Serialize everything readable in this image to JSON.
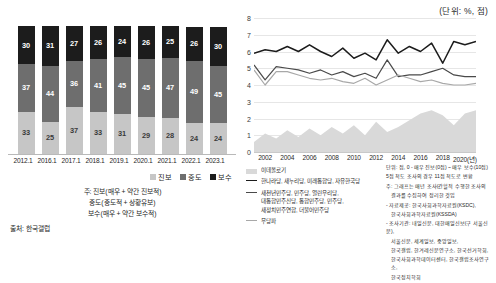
{
  "unit_label": "(단위: %, 점)",
  "left": {
    "legend": [
      {
        "key": "prog",
        "label": "진보",
        "color": "#c6c6c6"
      },
      {
        "key": "mod",
        "label": "중도",
        "color": "#6e6e6e"
      },
      {
        "key": "cons",
        "label": "보수",
        "color": "#1c1c1c"
      }
    ],
    "notes": [
      "주: 진보(매우 + 약간 진보적)",
      "중도(중도적 + 상황유보)",
      "보수(매우 + 약간 보수적)"
    ],
    "source": "출처: 한국갤럽"
  },
  "right": {
    "xaxis_suffix": "2020(년)",
    "legend": [
      {
        "key": "ideology",
        "mark": "area",
        "label": "이데올로기"
      },
      {
        "key": "conservative_parties",
        "mark": "line",
        "label": "한나라당, 새누리당, 미래통합당, 자유한국당"
      },
      {
        "key": "progressive_parties",
        "mark": "line2",
        "label": "새천년민주당, 민주당, 열린우리당,\n대통합민주신당, 통합민주당, 민주당,\n새정치민주연합, 더불어민주당"
      },
      {
        "key": "independent",
        "mark": "line3",
        "label": "무당파"
      }
    ],
    "notes": [
      "단위: 점, 0 - 매우 진보(0점) ~ 매우 보수(10점)",
      "5점 척도 조사의 경우 11점 척도로 변환",
      "주: 그래프는 매년 조사(간헐적 수행한 조사의",
      "결과를 수집하여 정리한 것임",
      "- 자료제공: 한국사회과학자료원(KSDC),",
      "한국사회과학자료원(KSSDA)",
      "- 조사기관: 내일신문, 대한매일신보(구 서울신문),",
      "서울신문, 세계일보, 중앙일보,",
      "한국갤럽, 한겨레신문연구소, 한국선거학회,",
      "한국사회과학데이터센터, 한국갤럽조사연구소,",
      "한국정치학회"
    ]
  },
  "chart_data": [
    {
      "type": "bar",
      "title": "이념성향 분포",
      "xlabel": "",
      "ylabel": "",
      "ylim": [
        0,
        100
      ],
      "stacked": true,
      "grid": false,
      "legend_position": "bottom-right",
      "categories": [
        "2012.1",
        "2016.1",
        "2017.1",
        "2018.1",
        "2019.1",
        "2020.1",
        "2021.1",
        "2022.1",
        "2023.1"
      ],
      "series": [
        {
          "name": "보수",
          "color": "#1c1c1c",
          "values": [
            30,
            31,
            27,
            26,
            24,
            26,
            25,
            26,
            30
          ]
        },
        {
          "name": "중도",
          "color": "#6e6e6e",
          "values": [
            37,
            44,
            36,
            41,
            45,
            45,
            47,
            49,
            45
          ]
        },
        {
          "name": "진보",
          "color": "#c6c6c6",
          "values": [
            33,
            25,
            37,
            33,
            31,
            29,
            28,
            24,
            24
          ]
        }
      ]
    },
    {
      "type": "line",
      "title": "",
      "xlabel": "년",
      "ylabel": "",
      "ylim": [
        0,
        8
      ],
      "yticks": [
        0,
        1,
        2,
        3,
        4,
        5,
        6,
        7,
        8
      ],
      "xlim": [
        2001,
        2021
      ],
      "xticks": [
        2002,
        2004,
        2006,
        2008,
        2010,
        2012,
        2014,
        2016,
        2018,
        2020
      ],
      "grid": true,
      "legend_position": "bottom-left",
      "x": [
        2001,
        2002,
        2003,
        2004,
        2005,
        2006,
        2007,
        2008,
        2009,
        2010,
        2011,
        2012,
        2013,
        2014,
        2015,
        2016,
        2017,
        2018,
        2019,
        2020,
        2021
      ],
      "series": [
        {
          "name": "한나라당, 새누리당, 미래통합당, 자유한국당",
          "color": "#1c1c1c",
          "type": "line",
          "values": [
            5.9,
            6.1,
            6.0,
            6.3,
            6.0,
            6.4,
            6.0,
            5.7,
            6.2,
            5.6,
            5.9,
            5.5,
            6.7,
            5.9,
            6.3,
            6.0,
            6.5,
            5.3,
            6.6,
            6.4,
            6.6
          ]
        },
        {
          "name": "새천년민주당, 민주당, 열린우리당, 대통합민주신당, 통합민주당, 민주당, 새정치민주연합, 더불어민주당",
          "color": "#4a4a4a",
          "type": "line",
          "values": [
            5.2,
            4.3,
            5.1,
            5.0,
            4.9,
            4.7,
            4.9,
            4.6,
            4.8,
            4.5,
            4.7,
            4.4,
            5.5,
            4.5,
            4.6,
            4.6,
            4.8,
            5.0,
            4.6,
            4.5,
            4.5
          ]
        },
        {
          "name": "무당파",
          "color": "#a8a8a8",
          "type": "line",
          "values": [
            4.9,
            4.0,
            4.8,
            4.8,
            4.6,
            4.4,
            4.3,
            4.4,
            4.2,
            4.1,
            4.4,
            4.0,
            4.3,
            4.6,
            4.4,
            4.2,
            4.3,
            4.1,
            4.0,
            4.0,
            4.1
          ]
        },
        {
          "name": "이데올로기",
          "color": "#d9d9d9",
          "type": "area",
          "values": [
            0.6,
            1.1,
            0.8,
            1.3,
            0.9,
            1.4,
            1.0,
            1.5,
            1.1,
            1.6,
            1.0,
            1.8,
            1.2,
            1.5,
            1.9,
            2.3,
            2.5,
            2.2,
            1.6,
            2.3,
            2.5
          ]
        }
      ]
    }
  ]
}
